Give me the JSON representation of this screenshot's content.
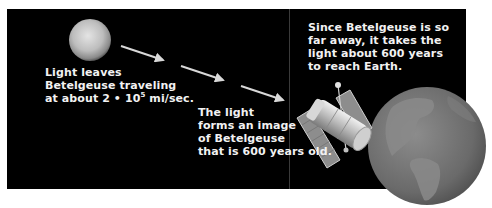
{
  "diagram": {
    "colors": {
      "background": "#000000",
      "page": "#ffffff",
      "text": "#f2f2f2",
      "arrow": "#d8d8d8",
      "divider": "#3a3a3a"
    },
    "nodes": [
      {
        "id": "betelgeuse",
        "label": "Betelgeuse (star)",
        "icon": "star-sphere-icon"
      },
      {
        "id": "telescope",
        "label": "Space telescope",
        "icon": "space-telescope-icon"
      },
      {
        "id": "earth",
        "label": "Earth",
        "icon": "earth-globe-icon"
      }
    ],
    "arrows": [
      {
        "from": "betelgeuse",
        "to": "telescope",
        "segment": 1
      },
      {
        "from": "betelgeuse",
        "to": "telescope",
        "segment": 2
      },
      {
        "from": "betelgeuse",
        "to": "telescope",
        "segment": 3
      }
    ],
    "captions": {
      "leaves": {
        "line1": "Light leaves",
        "line2": "Betelgeuse traveling",
        "line3_prefix": "at about 2 • 10",
        "line3_exponent": "5",
        "line3_suffix": " mi/sec."
      },
      "image": {
        "line1": "The light",
        "line2": "forms an image",
        "line3": "of Betelgeuse",
        "line4": "that is 600 years old."
      },
      "distance": {
        "line1": "Since Betelgeuse is so",
        "line2": "far away, it takes the",
        "line3": "light about 600 years",
        "line4": "to reach Earth."
      }
    }
  }
}
